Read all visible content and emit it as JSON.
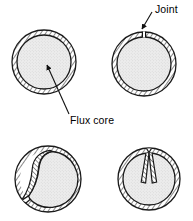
{
  "figure": {
    "background_color": "#ffffff",
    "line_color": "#1a1a1a",
    "core_fill_color": "#e8e8e8",
    "sheath_fill_color": "#ffffff",
    "labels": [
      {
        "id": "joint",
        "text": "Joint",
        "x": 155,
        "y": 13,
        "anchor": "start"
      },
      {
        "id": "flux_core",
        "text": "Flux core",
        "x": 70,
        "y": 124,
        "anchor": "start"
      }
    ],
    "leaders": [
      {
        "id": "joint-leader",
        "from_x": 152,
        "from_y": 12,
        "to_x": 142,
        "to_y": 29,
        "arrow": "end"
      },
      {
        "id": "flux-core-leader",
        "from_x": 69,
        "from_y": 114,
        "to_x": 47,
        "to_y": 65,
        "arrow": "end"
      }
    ],
    "sections": [
      {
        "id": "section-closed-butt",
        "name": "closed-seam-cross-section",
        "cx": 44,
        "cy": 62,
        "r_outer": 32,
        "r_inner": 27,
        "seam": "none",
        "row": 1,
        "col": 1
      },
      {
        "id": "section-butt-joint",
        "name": "butt-joint-cross-section",
        "cx": 144,
        "cy": 64,
        "r_outer": 32,
        "r_inner": 27,
        "seam": "butt-gap-top",
        "row": 1,
        "col": 2
      },
      {
        "id": "section-lap-seam",
        "name": "lap-seam-cross-section",
        "cx": 48,
        "cy": 179,
        "r_outer": 33,
        "r_inner": 28,
        "seam": "overlap-left",
        "row": 2,
        "col": 1
      },
      {
        "id": "section-folded-seam",
        "name": "folded-seam-cross-section",
        "cx": 149,
        "cy": 179,
        "r_outer": 31,
        "r_inner": 26,
        "seam": "double-fold-top",
        "row": 2,
        "col": 2
      }
    ]
  }
}
